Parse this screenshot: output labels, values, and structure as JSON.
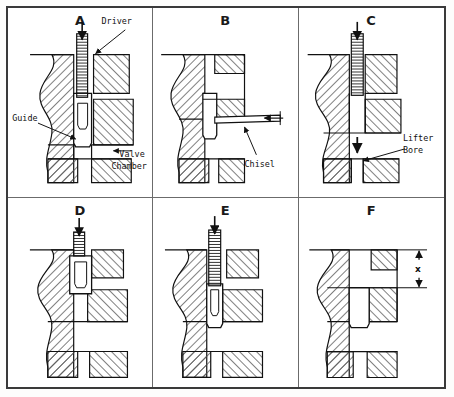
{
  "figure": {
    "panel_count": 6,
    "grid": {
      "columns": 3,
      "rows": 2
    }
  },
  "panels": [
    {
      "id": "A",
      "letter": "A",
      "name": "panel-a",
      "labels": [
        {
          "name": "driver-label",
          "text": "Driver"
        },
        {
          "name": "guide-label",
          "text": "Guide"
        },
        {
          "name": "valve-chamber-label-line1",
          "text": "Valve"
        },
        {
          "name": "valve-chamber-label-line2",
          "text": "Chamber"
        }
      ]
    },
    {
      "id": "B",
      "letter": "B",
      "name": "panel-b",
      "labels": [
        {
          "name": "chisel-label",
          "text": "Chisel"
        }
      ]
    },
    {
      "id": "C",
      "letter": "C",
      "name": "panel-c",
      "labels": [
        {
          "name": "lifter-bore-label-line1",
          "text": "Lifter"
        },
        {
          "name": "lifter-bore-label-line2",
          "text": "Bore"
        }
      ]
    },
    {
      "id": "D",
      "letter": "D",
      "name": "panel-d",
      "labels": []
    },
    {
      "id": "E",
      "letter": "E",
      "name": "panel-e",
      "labels": []
    },
    {
      "id": "F",
      "letter": "F",
      "name": "panel-f",
      "labels": [
        {
          "name": "dimension-x-label",
          "text": "x"
        }
      ]
    }
  ],
  "colors": {
    "frame": "#3a3a3a",
    "divider": "#6b6b6b",
    "line": "#1a1a1a",
    "hatch": "#555555",
    "background": "#ffffff"
  }
}
